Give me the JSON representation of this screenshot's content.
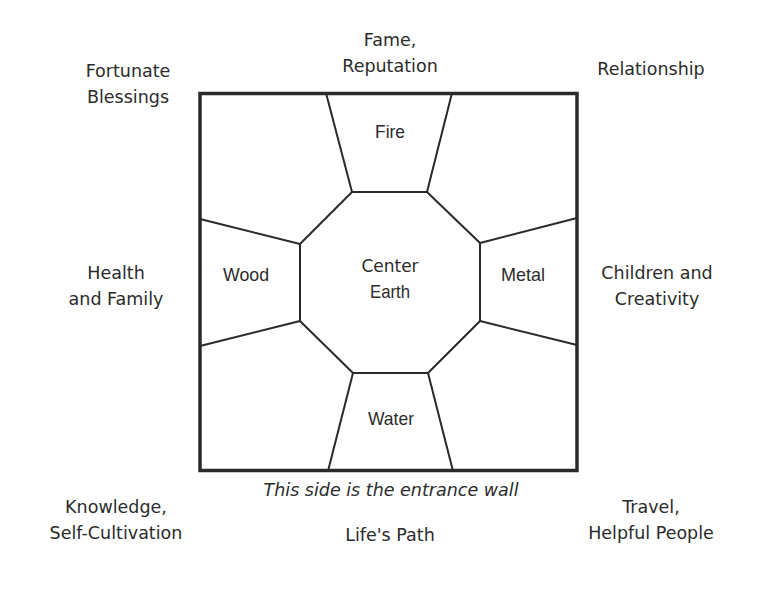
{
  "colors": {
    "stroke": "#2a2a2a",
    "text": "#2b2b2b",
    "background": "#ffffff"
  },
  "outer_areas": {
    "top_left": {
      "lines": [
        "Fortunate",
        "Blessings"
      ]
    },
    "top_center": {
      "lines": [
        "Fame,",
        "Reputation"
      ]
    },
    "top_right": {
      "lines": [
        "Relationship"
      ]
    },
    "middle_left": {
      "lines": [
        "Health",
        "and Family"
      ]
    },
    "middle_right": {
      "lines": [
        "Children and",
        "Creativity"
      ]
    },
    "bottom_left": {
      "lines": [
        "Knowledge,",
        "Self-Cultivation"
      ]
    },
    "bottom_center": {
      "lines": [
        "Life's Path"
      ]
    },
    "bottom_right": {
      "lines": [
        "Travel,",
        "Helpful People"
      ]
    }
  },
  "elements": {
    "top": "Fire",
    "left": "Wood",
    "right": "Metal",
    "bottom": "Water",
    "center_line1": "Center",
    "center_line2": "Earth"
  },
  "entrance_caption": "This side is the entrance wall"
}
